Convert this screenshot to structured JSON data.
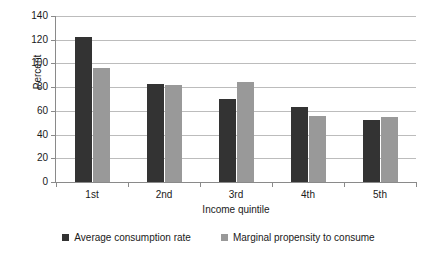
{
  "chart_data": {
    "type": "bar",
    "title": "",
    "subtitle": "",
    "xlabel": "Income quintile",
    "ylabel": "Percent",
    "categories": [
      "1st",
      "2nd",
      "3rd",
      "4th",
      "5th"
    ],
    "series": [
      {
        "name": "Average consumption rate",
        "color": "#333333",
        "values": [
          122,
          83,
          70,
          63,
          52
        ]
      },
      {
        "name": "Marginal propensity to consume",
        "color": "#999999",
        "values": [
          96,
          82,
          84,
          55.5,
          55
        ]
      }
    ],
    "ylim": [
      0,
      140
    ],
    "ytick_step": 20,
    "yticks": [
      140,
      120,
      100,
      80,
      60,
      40,
      20,
      0
    ],
    "ytick_labels": [
      "140",
      "120",
      "100",
      "80",
      "60",
      "40",
      "20",
      "0"
    ],
    "grid": true,
    "grid_axis": "y",
    "legend_position": "bottom",
    "gridline_color": "#bcbcbc",
    "axis_color": "#8a8a8a",
    "background_color": "#ffffff"
  }
}
